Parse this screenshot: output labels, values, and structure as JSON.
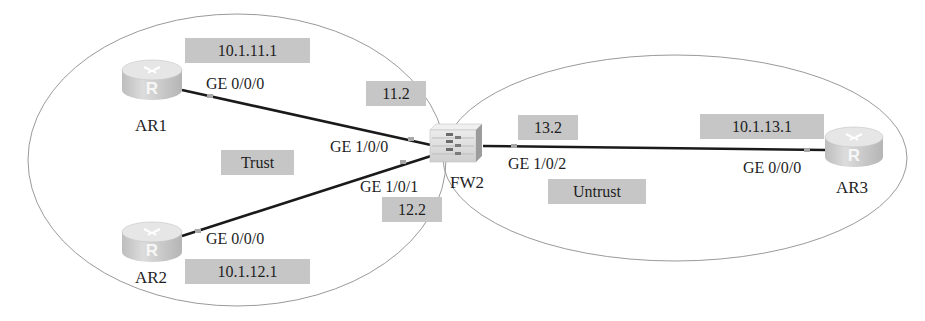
{
  "diagram": {
    "type": "network-topology",
    "zones": [
      {
        "name": "Trust",
        "label": "Trust"
      },
      {
        "name": "Untrust",
        "label": "Untrust"
      }
    ],
    "devices": {
      "ar1": {
        "name": "AR1",
        "kind": "router-icon",
        "interface": "GE 0/0/0",
        "ip": "10.1.11.1"
      },
      "ar2": {
        "name": "AR2",
        "kind": "router-icon",
        "interface": "GE 0/0/0",
        "ip": "10.1.12.1"
      },
      "ar3": {
        "name": "AR3",
        "kind": "router-icon",
        "interface": "GE 0/0/0",
        "ip": "10.1.13.1"
      },
      "fw2": {
        "name": "FW2",
        "kind": "firewall-icon",
        "interfaces": [
          {
            "name": "GE 1/0/0",
            "ip": "11.2",
            "peer": "AR1"
          },
          {
            "name": "GE 1/0/1",
            "ip": "12.2",
            "peer": "AR2"
          },
          {
            "name": "GE 1/0/2",
            "ip": "13.2",
            "peer": "AR3"
          }
        ]
      }
    },
    "links": [
      {
        "from": "AR1 GE 0/0/0",
        "to": "FW2 GE 1/0/0"
      },
      {
        "from": "AR2 GE 0/0/0",
        "to": "FW2 GE 1/0/1"
      },
      {
        "from": "FW2 GE 1/0/2",
        "to": "AR3 GE 0/0/0"
      }
    ],
    "colors": {
      "label_box": "#c6c6c6",
      "link": "#1a1a1a",
      "zone_border": "#9a9a9a",
      "port_dot": "#a8a8a8",
      "device": "#d4d4d4"
    }
  }
}
